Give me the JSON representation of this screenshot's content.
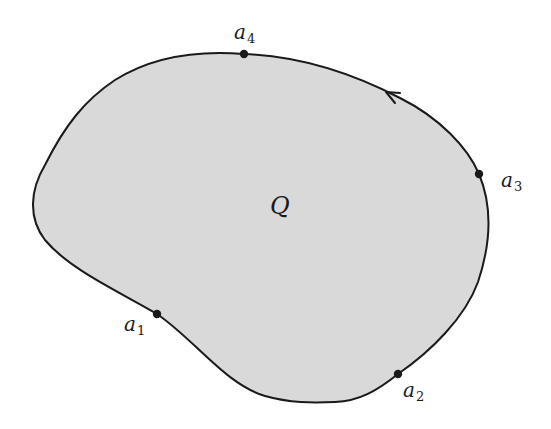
{
  "diagram": {
    "type": "closed-region-with-boundary-points",
    "region": {
      "label": "Q",
      "fill_color": "#d9d9d9",
      "stroke_color": "#1a1a1a"
    },
    "orientation": "counterclockwise",
    "arrow_icon": "arrowhead-icon",
    "points": [
      {
        "id": "a1",
        "letter": "a",
        "index": "1"
      },
      {
        "id": "a2",
        "letter": "a",
        "index": "2"
      },
      {
        "id": "a3",
        "letter": "a",
        "index": "3"
      },
      {
        "id": "a4",
        "letter": "a",
        "index": "4"
      }
    ]
  }
}
